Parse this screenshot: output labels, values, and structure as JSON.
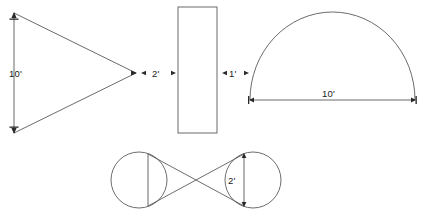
{
  "page": {
    "background_color": "#ffffff",
    "stroke_color": "#5a5a5a",
    "label_color": "#1a1a1a",
    "width": 425,
    "height": 217
  },
  "figures": [
    {
      "id": "triangle",
      "name": "triangle",
      "shape": "triangle",
      "label": "10'",
      "label_position": "left-side-interior",
      "vertices": [
        [
          14,
          13
        ],
        [
          14,
          133
        ],
        [
          136,
          73
        ]
      ],
      "dimension_side": "left-vertical",
      "arrowheads": [
        "top-left-vertex",
        "bottom-left-vertex",
        "right-apex"
      ]
    },
    {
      "id": "gap-left",
      "name": "dimension-gap-triangle-to-rectangle",
      "shape": "dimension",
      "label": "2'",
      "from_x": 140,
      "to_x": 176,
      "y": 73
    },
    {
      "id": "rectangle",
      "name": "rectangle",
      "shape": "rectangle",
      "label": "",
      "x": 178,
      "y": 7,
      "width": 39,
      "height": 126
    },
    {
      "id": "gap-right",
      "name": "dimension-gap-rectangle-to-semicircle",
      "shape": "dimension",
      "label": "1'",
      "from_x": 221,
      "to_x": 249,
      "y": 73
    },
    {
      "id": "semicircle",
      "name": "semicircle",
      "shape": "semicircle",
      "label": "10'",
      "label_position": "below-diameter-center",
      "diameter_left": [
        250,
        100
      ],
      "diameter_right": [
        415,
        100
      ],
      "apex_y": 12,
      "arrowheads": [
        "diameter-left-end",
        "diameter-right-end"
      ]
    },
    {
      "id": "bowtie",
      "name": "bowtie-two-circles",
      "shape": "bowtie",
      "label": "2'",
      "label_position": "right-chord-interior",
      "left_circle_center": [
        139,
        180
      ],
      "left_circle_radius": 28,
      "right_circle_center": [
        253,
        180
      ],
      "right_circle_radius": 28,
      "left_chord_x": 148,
      "right_chord_x": 244,
      "chord_top_y": 154,
      "chord_bottom_y": 206,
      "arrowheads": [
        "right-chord-top",
        "right-chord-bottom"
      ]
    }
  ],
  "labels": {
    "triangle_height": "10'",
    "gap_triangle_rect": "2'",
    "gap_rect_semicircle": "1'",
    "semicircle_diameter": "10'",
    "bowtie_chord": "2'"
  }
}
